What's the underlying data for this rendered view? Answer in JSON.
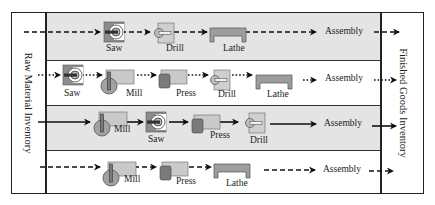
{
  "diagram": {
    "left_inventory_label": "Raw Material Inventory",
    "right_inventory_label": "Finished Goods Inventory",
    "colors": {
      "shaded_row": "#e4e4e4",
      "machine_light": "#c4c4c4",
      "machine_mid": "#9a9a9a",
      "machine_dark": "#6e6e6e",
      "line": "#111111"
    },
    "routes": [
      {
        "id": 1,
        "line_style": "dashed",
        "shaded": true,
        "steps": [
          "Saw",
          "Drill",
          "Lathe"
        ],
        "end_label": "Assembly"
      },
      {
        "id": 2,
        "line_style": "dotted",
        "shaded": false,
        "steps": [
          "Saw",
          "Mill",
          "Press",
          "Drill",
          "Lathe"
        ],
        "end_label": "Assembly"
      },
      {
        "id": 3,
        "line_style": "solid",
        "shaded": true,
        "steps": [
          "Mill",
          "Saw",
          "Press",
          "Drill"
        ],
        "end_label": "Assembly"
      },
      {
        "id": 4,
        "line_style": "dashed",
        "shaded": false,
        "steps": [
          "Mill",
          "Press",
          "Lathe"
        ],
        "end_label": "Assembly"
      }
    ]
  }
}
